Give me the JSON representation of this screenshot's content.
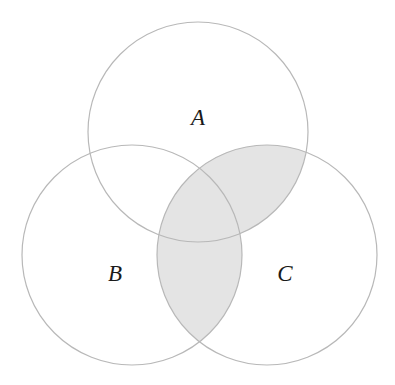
{
  "diagram": {
    "type": "venn",
    "sets": [
      {
        "id": "A",
        "label": "A",
        "cx": 198,
        "cy": 132,
        "r": 110,
        "label_x": 198,
        "label_y": 125
      },
      {
        "id": "B",
        "label": "B",
        "cx": 132,
        "cy": 255,
        "r": 110,
        "label_x": 115,
        "label_y": 281
      },
      {
        "id": "C",
        "label": "C",
        "cx": 267,
        "cy": 255,
        "r": 110,
        "label_x": 285,
        "label_y": 281
      }
    ],
    "shaded_region": "C ∩ (A ∪ B)",
    "colors": {
      "stroke": "#b8b8b8",
      "shade": "#e4e4e4",
      "background": "#ffffff",
      "text": "#1a1a1a"
    }
  }
}
